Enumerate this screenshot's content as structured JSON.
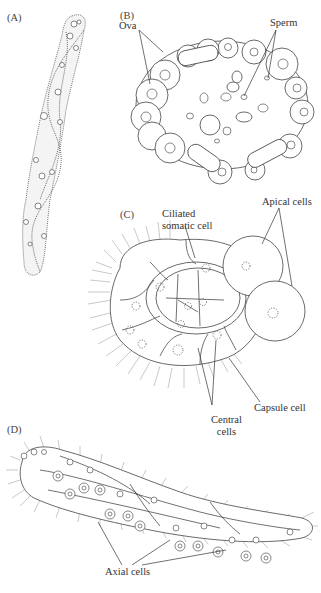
{
  "figure": {
    "panels": [
      {
        "id": "A",
        "label": "(A)",
        "annotations": []
      },
      {
        "id": "B",
        "label": "(B)",
        "annotations": [
          {
            "text": "Ova",
            "key": "ova"
          },
          {
            "text": "Sperm",
            "key": "sperm"
          }
        ]
      },
      {
        "id": "C",
        "label": "(C)",
        "annotations": [
          {
            "text": "Ciliated\nsomatic cell",
            "key": "ciliated_somatic_cell"
          },
          {
            "text": "Apical cells",
            "key": "apical_cells"
          },
          {
            "text": "Capsule cell",
            "key": "capsule_cell"
          },
          {
            "text": "Central\ncells",
            "key": "central_cells"
          }
        ]
      },
      {
        "id": "D",
        "label": "(D)",
        "annotations": [
          {
            "text": "Axial cells",
            "key": "axial_cells"
          }
        ]
      }
    ]
  },
  "labels": {
    "panel_a": "(A)",
    "panel_b": "(B)",
    "panel_c": "(C)",
    "panel_d": "(D)",
    "ova": "Ova",
    "sperm": "Sperm",
    "ciliated_line1": "Ciliated",
    "ciliated_line2": "somatic cell",
    "apical_cells": "Apical cells",
    "capsule_cell": "Capsule cell",
    "central_line1": "Central",
    "central_line2": "cells",
    "axial_cells": "Axial cells"
  }
}
